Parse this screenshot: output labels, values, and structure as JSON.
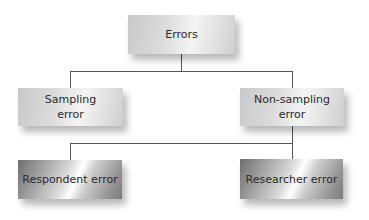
{
  "diagram": {
    "type": "tree",
    "root": {
      "label": "Errors",
      "children": [
        {
          "label": "Sampling error",
          "lines": [
            "Sampling",
            "error"
          ]
        },
        {
          "label": "Non-sampling error",
          "lines": [
            "Non-sampling",
            "error"
          ],
          "children": [
            {
              "label": "Respondent error"
            },
            {
              "label": "Researcher error"
            }
          ]
        }
      ]
    }
  },
  "nodes": {
    "errors": "Errors",
    "sampling_line1": "Sampling",
    "sampling_line2": "error",
    "nonsampling_line1": "Non-sampling",
    "nonsampling_line2": "error",
    "respondent": "Respondent error",
    "researcher": "Researcher error"
  },
  "colors": {
    "line": "#555555",
    "text": "#2a2a2a",
    "box_light": "#e0e0e0",
    "box_metal": "#a8a8a8"
  }
}
